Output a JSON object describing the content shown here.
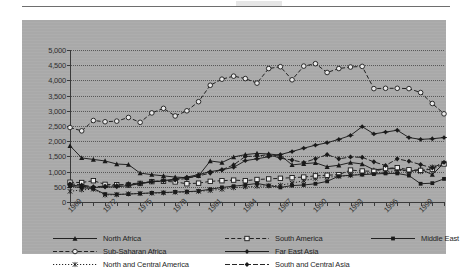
{
  "figure": {
    "background_hex": "#a9a9a9",
    "ink_hex": "#1f1f1f",
    "top_rule": true
  },
  "chart_data": {
    "type": "line",
    "title": "",
    "subtitle": "",
    "xlabel": "",
    "ylabel": "",
    "grid": true,
    "legend_position": "bottom",
    "ylim": [
      0,
      5000
    ],
    "yticks": [
      0,
      500,
      1000,
      1500,
      2000,
      2500,
      3000,
      3500,
      4000,
      4500,
      5000
    ],
    "ytick_labels": [
      "0",
      "500",
      "1,000",
      "1,500",
      "2,000",
      "2,500",
      "3,000",
      "3,500",
      "4,000",
      "4,500",
      "5,000"
    ],
    "x": [
      1969,
      1970,
      1971,
      1972,
      1973,
      1974,
      1975,
      1976,
      1977,
      1978,
      1979,
      1980,
      1981,
      1982,
      1983,
      1984,
      1985,
      1986,
      1987,
      1988,
      1989,
      1990,
      1991,
      1992,
      1993,
      1994,
      1995,
      1996,
      1997,
      1998,
      1999,
      2000,
      2001
    ],
    "xtick_labels": [
      "1969",
      "1972",
      "1975",
      "1978",
      "1981",
      "1984",
      "1987",
      "1990",
      "1993",
      "1996",
      "1999"
    ],
    "xtick_values": [
      1969,
      1972,
      1975,
      1978,
      1981,
      1984,
      1987,
      1990,
      1993,
      1996,
      1999
    ],
    "series": [
      {
        "name": "North Africa",
        "marker": "triangle",
        "line_style": "solid",
        "values": [
          1850,
          1450,
          1400,
          1350,
          1250,
          1230,
          950,
          900,
          860,
          820,
          800,
          860,
          1350,
          1300,
          1480,
          1560,
          1600,
          1580,
          1540,
          1220,
          1260,
          1290,
          1160,
          1210,
          1300,
          1250,
          1060,
          1090,
          1100,
          1000,
          1080,
          900,
          1280
        ]
      },
      {
        "name": "Sub-Saharan Africa",
        "marker": "open-circle",
        "line_style": "dashed",
        "values": [
          2450,
          2340,
          2680,
          2640,
          2660,
          2780,
          2620,
          2930,
          3080,
          2830,
          3000,
          3300,
          3840,
          4040,
          4140,
          4060,
          3910,
          4390,
          4450,
          4020,
          4470,
          4550,
          4260,
          4390,
          4440,
          4460,
          3730,
          3740,
          3740,
          3730,
          3600,
          3240,
          2900
        ]
      },
      {
        "name": "North and Central America",
        "marker": "x",
        "line_style": "dotted",
        "values": [
          350,
          400,
          420,
          230,
          240,
          270,
          280,
          290,
          300,
          320,
          330,
          350,
          380,
          420,
          470,
          500,
          520,
          530,
          550,
          620,
          700,
          780,
          820,
          840,
          880,
          920,
          960,
          980,
          1040,
          1020,
          1000,
          1150,
          1280
        ]
      },
      {
        "name": "South America",
        "marker": "open-square",
        "line_style": "dashed",
        "values": [
          650,
          640,
          700,
          580,
          570,
          560,
          610,
          670,
          680,
          660,
          600,
          620,
          680,
          700,
          720,
          700,
          740,
          760,
          780,
          800,
          820,
          860,
          880,
          900,
          1050,
          1020,
          1010,
          1100,
          1130,
          1060,
          1040,
          1080,
          1250
        ]
      },
      {
        "name": "Far East Asia",
        "marker": "plus-diamond",
        "line_style": "solid",
        "values": [
          560,
          520,
          480,
          490,
          500,
          540,
          600,
          660,
          700,
          760,
          820,
          900,
          1000,
          1060,
          1140,
          1360,
          1420,
          1490,
          1560,
          1660,
          1770,
          1870,
          1950,
          2060,
          2190,
          2480,
          2240,
          2300,
          2360,
          2120,
          2060,
          2080,
          2120
        ]
      },
      {
        "name": "South and Central Asia",
        "marker": "filled-diamond",
        "line_style": "dash",
        "values": [
          600,
          560,
          500,
          520,
          540,
          600,
          620,
          680,
          700,
          720,
          780,
          860,
          950,
          1060,
          1220,
          1500,
          1510,
          1560,
          1440,
          1380,
          1300,
          1420,
          1560,
          1420,
          1480,
          1470,
          1320,
          1200,
          1420,
          1340,
          1230,
          1120,
          1300
        ]
      },
      {
        "name": "Middle East",
        "marker": "filled-square",
        "line_style": "solid",
        "values": [
          520,
          470,
          440,
          260,
          250,
          260,
          280,
          300,
          310,
          330,
          340,
          360,
          420,
          480,
          520,
          560,
          610,
          540,
          480,
          540,
          560,
          600,
          680,
          850,
          880,
          900,
          920,
          940,
          940,
          870,
          600,
          620,
          760
        ]
      }
    ]
  },
  "legend": {
    "columns": [
      {
        "items": [
          {
            "label": "North Africa",
            "key": "line-key-north-africa"
          },
          {
            "label": "Sub-Saharan Africa",
            "key": "line-key-sub-saharan-africa"
          },
          {
            "label": "North and Central America",
            "key": "line-key-north-and-central-america"
          }
        ]
      },
      {
        "items": [
          {
            "label": "South America",
            "key": "line-key-south-america"
          },
          {
            "label": "Far East Asia",
            "key": "line-key-far-east-asia"
          },
          {
            "label": "South and Central Asia",
            "key": "line-key-south-and-central-asia"
          }
        ]
      },
      {
        "items": [
          {
            "label": "Middle East",
            "key": "line-key-middle-east"
          }
        ]
      }
    ]
  }
}
